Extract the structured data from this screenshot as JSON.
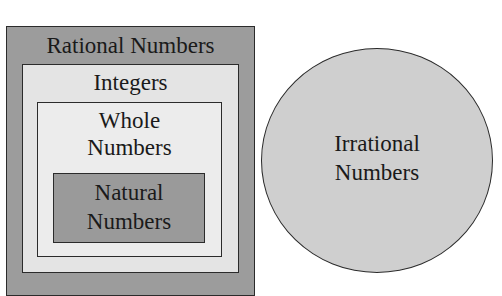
{
  "diagram": {
    "type": "nested-set-diagram",
    "sets": [
      {
        "id": "rational",
        "label": "Rational Numbers",
        "fill": "#9c9c9c",
        "contains": [
          "integers"
        ]
      },
      {
        "id": "integers",
        "label": "Integers",
        "fill": "#e4e4e4",
        "contains": [
          "whole"
        ]
      },
      {
        "id": "whole",
        "label": "Whole\nNumbers",
        "fill": "#ececec",
        "contains": [
          "natural"
        ]
      },
      {
        "id": "natural",
        "label": "Natural\nNumbers",
        "fill": "#9a9a9a",
        "contains": []
      },
      {
        "id": "irrational",
        "label": "Irrational\nNumbers",
        "fill": "#cfcfcf",
        "shape": "circle",
        "contains": []
      }
    ]
  },
  "labels": {
    "rational": "Rational Numbers",
    "integers": "Integers",
    "whole": "Whole\nNumbers",
    "natural": "Natural\nNumbers",
    "irrational": "Irrational\nNumbers"
  }
}
